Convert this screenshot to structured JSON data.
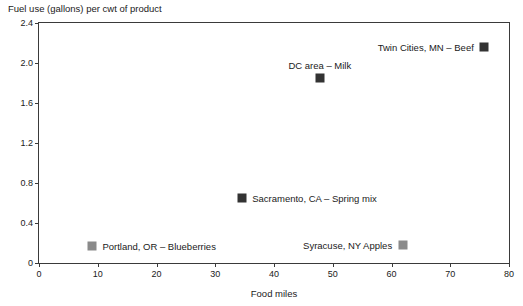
{
  "chart_data": {
    "type": "scatter",
    "title": "Fuel use (gallons) per cwt of product",
    "xlabel": "Food miles",
    "ylabel": "Fuel use (gallons) per cwt of product",
    "xlim": [
      0,
      80
    ],
    "ylim": [
      0,
      2.4
    ],
    "grid": false,
    "legend": "none (points labeled directly)",
    "xticks": [
      "0",
      "10",
      "20",
      "30",
      "40",
      "50",
      "60",
      "70",
      "80"
    ],
    "xtick_values": [
      0,
      10,
      20,
      30,
      40,
      50,
      60,
      70,
      80
    ],
    "yticks": [
      "0",
      "0.4",
      "0.8",
      "1.2",
      "1.6",
      "2.0",
      "2.4"
    ],
    "ytick_values": [
      0,
      0.4,
      0.8,
      1.2,
      1.6,
      2.0,
      2.4
    ],
    "points": [
      {
        "label": "Twin Cities, MN – Beef",
        "x": 75.8,
        "y": 2.16,
        "color": "#333333",
        "label_position": "left"
      },
      {
        "label": "DC area – Milk",
        "x": 47.8,
        "y": 1.85,
        "color": "#333333",
        "label_position": "above"
      },
      {
        "label": "Sacramento, CA – Spring mix",
        "x": 34.5,
        "y": 0.65,
        "color": "#333333",
        "label_position": "right"
      },
      {
        "label": "Portland, OR – Blueberries",
        "x": 9.0,
        "y": 0.17,
        "color": "#8a8a8a",
        "label_position": "right"
      },
      {
        "label": "Syracuse, NY Apples",
        "x": 61.9,
        "y": 0.18,
        "color": "#8a8a8a",
        "label_position": "left"
      }
    ]
  },
  "colors": {
    "axis": "#3a3a3a",
    "text": "#1a1a1a",
    "marker_dark": "#333333",
    "marker_gray": "#8a8a8a",
    "background": "#ffffff"
  }
}
